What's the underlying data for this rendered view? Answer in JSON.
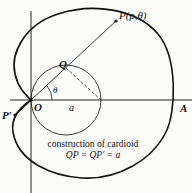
{
  "figure": {
    "labels": {
      "P": "P(ρ,θ)",
      "Q": "Q",
      "theta": "θ",
      "O": "O",
      "a": "a",
      "A": "A",
      "P_prime": "P′"
    },
    "caption": {
      "line1": "construction of cardioid",
      "line2": "QP = QP′ = a"
    },
    "colors": {
      "ink": "#111111",
      "background": "#fbfbfa"
    }
  }
}
